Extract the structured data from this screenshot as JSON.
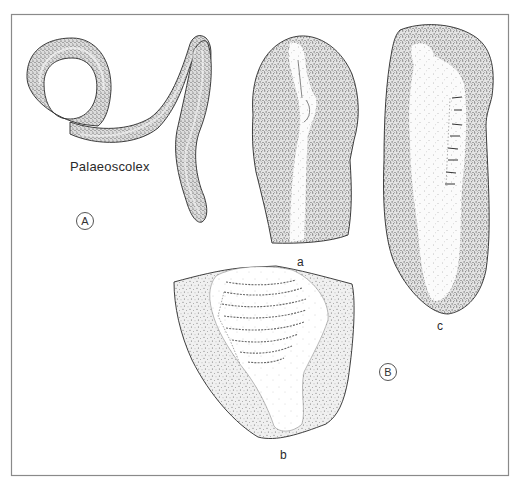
{
  "figure": {
    "frame": {
      "left": 11,
      "top": 14,
      "right": 509,
      "bottom": 476,
      "stroke": "#8a8a8a"
    },
    "ink_color": "#2a2a2a",
    "stipple_color": "#3a3a3a",
    "panels": [
      {
        "id": "A",
        "marker": "A",
        "caption": "Palaeoscolex",
        "specimens": [
          {
            "id": "palaeoscolex-worm",
            "description": "Long annulated worm, looped at left end, curving down at right end"
          }
        ]
      },
      {
        "id": "B",
        "marker": "B",
        "specimens": [
          {
            "id": "a",
            "label": "a",
            "description": "Rounded-top slab with pale central axial strip"
          },
          {
            "id": "b",
            "label": "b",
            "description": "Triangular slab with transversely ridged pale body"
          },
          {
            "id": "c",
            "label": "c",
            "description": "Elongate slab with pale central body and short dashed annulations"
          }
        ]
      }
    ]
  },
  "labels": {
    "genus": "Palaeoscolex",
    "panel_a_marker": "A",
    "panel_b_marker": "B",
    "specimen_a": "a",
    "specimen_b": "b",
    "specimen_c": "c"
  }
}
